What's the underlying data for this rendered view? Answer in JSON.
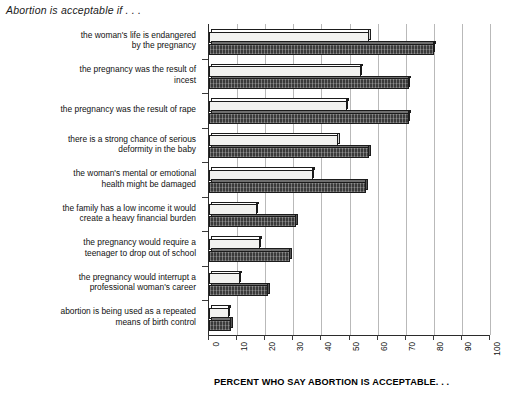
{
  "chart_data": {
    "type": "bar",
    "orientation": "horizontal",
    "title": "Abortion is acceptable if . . .",
    "xlabel": "PERCENT WHO SAY ABORTION IS ACCEPTABLE. . .",
    "ylabel": "",
    "xlim": [
      0,
      100
    ],
    "xticks": [
      "0",
      "10",
      "20",
      "30",
      "40",
      "50",
      "60",
      "70",
      "80",
      "90",
      "100"
    ],
    "grid": true,
    "legend": "none",
    "categories": [
      "the woman's life is endangered by the pregnancy",
      "the pregnancy was the result of incest",
      "the pregnancy was the result of rape",
      "there is a strong chance of serious deformity in the baby",
      "the woman's mental or emotional health might be damaged",
      "the family has a low income it would create a heavy financial burden",
      "the pregnancy would require a teenager to drop out of school",
      "the pregnancy would interrupt a professional woman's career",
      "abortion is being used as a repeated means of birth control"
    ],
    "series": [
      {
        "name": "light",
        "values": [
          57,
          54,
          49,
          46,
          37,
          17,
          18,
          11,
          7
        ]
      },
      {
        "name": "dark",
        "values": [
          80,
          71,
          71,
          57,
          56,
          31,
          29,
          21,
          8
        ]
      }
    ]
  },
  "labels": {
    "cat_lines": [
      [
        "the woman's life is endangered",
        "by the pregnancy"
      ],
      [
        "the pregnancy was the result of",
        "incest"
      ],
      [
        "the pregnancy was the result of rape"
      ],
      [
        "there is a strong chance of serious",
        "deformity in the baby"
      ],
      [
        "the woman's mental or emotional",
        "health might be damaged"
      ],
      [
        "the family has a low income it would",
        "create a heavy financial burden"
      ],
      [
        "the pregnancy would require a",
        "teenager to drop out of school"
      ],
      [
        "the pregnancy would interrupt a",
        "professional woman's career"
      ],
      [
        "abortion is being used as a repeated",
        "means of birth control"
      ]
    ]
  },
  "colors": {
    "light_bar": "#f2f2f0",
    "dark_bar": "#3a3a3a",
    "grid": "#b9b9b9",
    "axis": "#2b2b2b",
    "text": "#111111"
  }
}
